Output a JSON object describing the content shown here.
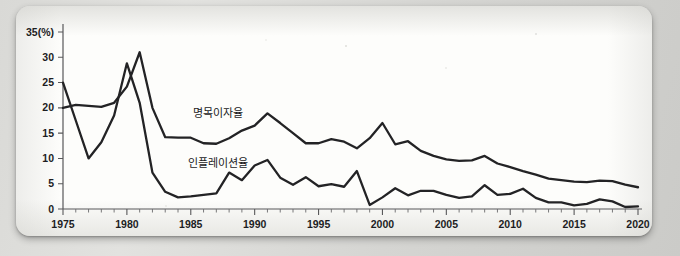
{
  "figure": {
    "background_color": "#cfcfcc",
    "card_color": "#fdfdfb",
    "ink_color": "#232325",
    "axis_color": "#58585a"
  },
  "chart_data": {
    "type": "line",
    "title": "",
    "xlabel": "",
    "ylabel": "35(%)",
    "y_axis_caption": "35(%)",
    "xlim": [
      1975,
      2020
    ],
    "ylim": [
      0,
      35
    ],
    "grid": false,
    "legend": "inline-annotation",
    "y_ticks": [
      0,
      5,
      10,
      15,
      20,
      25,
      30,
      35
    ],
    "y_tick_labels": [
      "0",
      "5",
      "10",
      "15",
      "20",
      "25",
      "30",
      "35(%)"
    ],
    "x_ticks": [
      1975,
      1976,
      1977,
      1978,
      1979,
      1980,
      1981,
      1982,
      1983,
      1984,
      1985,
      1986,
      1987,
      1988,
      1989,
      1990,
      1991,
      1992,
      1993,
      1994,
      1995,
      1996,
      1997,
      1998,
      1999,
      2000,
      2001,
      2002,
      2003,
      2004,
      2005,
      2006,
      2007,
      2008,
      2009,
      2010,
      2011,
      2012,
      2013,
      2014,
      2015,
      2016,
      2017,
      2018,
      2019,
      2020
    ],
    "x_tick_labels_shown": [
      "1975",
      "1980",
      "1985",
      "1990",
      "1995",
      "2000",
      "2005",
      "2010",
      "2015",
      "2020"
    ],
    "x": [
      1975,
      1976,
      1977,
      1978,
      1979,
      1980,
      1981,
      1982,
      1983,
      1984,
      1985,
      1986,
      1987,
      1988,
      1989,
      1990,
      1991,
      1992,
      1993,
      1994,
      1995,
      1996,
      1997,
      1998,
      1999,
      2000,
      2001,
      2002,
      2003,
      2004,
      2005,
      2006,
      2007,
      2008,
      2009,
      2010,
      2011,
      2012,
      2013,
      2014,
      2015,
      2016,
      2017,
      2018,
      2019,
      2020
    ],
    "series": [
      {
        "name": "명목이자율",
        "label": "명목이자율",
        "label_x": 1985.2,
        "label_y": 18.2,
        "color": "#232325",
        "values": [
          20.0,
          20.6,
          20.4,
          20.2,
          21.0,
          24.2,
          31.0,
          20.0,
          14.2,
          14.1,
          14.1,
          13.0,
          12.9,
          14.0,
          15.5,
          16.5,
          18.9,
          17.0,
          15.0,
          13.0,
          13.0,
          13.8,
          13.3,
          12.0,
          14.0,
          17.0,
          12.8,
          13.4,
          11.5,
          10.5,
          9.8,
          9.5,
          9.6,
          10.5,
          9.0,
          8.3,
          7.5,
          6.8,
          6.0,
          5.7,
          5.4,
          5.3,
          5.6,
          5.5,
          4.8,
          4.3
        ]
      },
      {
        "name": "인플레이션율",
        "label": "인플레이션율",
        "label_x": 1984.8,
        "label_y": 8.3,
        "color": "#232325",
        "values": [
          25.0,
          17.5,
          10.0,
          13.2,
          18.5,
          28.8,
          21.0,
          7.2,
          3.4,
          2.3,
          2.5,
          2.8,
          3.1,
          7.2,
          5.7,
          8.6,
          9.7,
          6.2,
          4.8,
          6.3,
          4.5,
          4.9,
          4.4,
          7.5,
          0.8,
          2.3,
          4.1,
          2.7,
          3.6,
          3.6,
          2.8,
          2.2,
          2.5,
          4.7,
          2.8,
          3.0,
          4.0,
          2.2,
          1.3,
          1.3,
          0.7,
          1.0,
          1.9,
          1.5,
          0.4,
          0.5
        ]
      }
    ]
  }
}
